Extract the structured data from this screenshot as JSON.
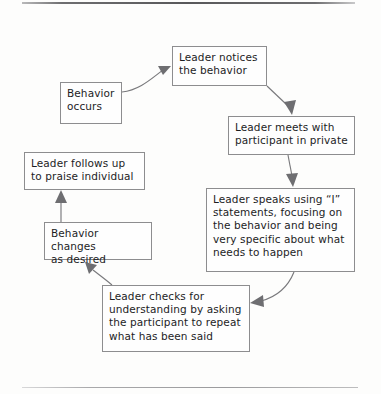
{
  "page": {
    "background_color": "#fdfdfc",
    "border_color": "#8d8d8f",
    "text_color": "#1d1d1f",
    "edge_color": "#79797c"
  },
  "rules": {
    "top_rule_label": "top-divider-rule",
    "bottom_rule_label": "bottom-divider-rule"
  },
  "diagram": {
    "type": "cycle-flowchart",
    "nodes": [
      {
        "id": "behavior-occurs",
        "text": "Behavior\noccurs",
        "lines": [
          "Behavior",
          "occurs"
        ],
        "x": 60,
        "y": 82,
        "w": 62,
        "h": 42
      },
      {
        "id": "leader-notices",
        "text": "Leader notices\nthe behavior",
        "lines": [
          "Leader notices",
          "the behavior"
        ],
        "x": 172,
        "y": 46,
        "w": 95,
        "h": 40
      },
      {
        "id": "leader-meets",
        "text": "Leader meets with\nparticipant in private",
        "lines": [
          "Leader meets with",
          "participant in private"
        ],
        "x": 228,
        "y": 116,
        "w": 127,
        "h": 39
      },
      {
        "id": "leader-speaks",
        "text": "Leader speaks using “I” statements, focusing on the behavior and being very specific about what needs to happen",
        "lines": [
          "Leader speaks using “I”",
          "statements, focusing on",
          "the behavior and being",
          "very specific about what",
          "needs to happen"
        ],
        "x": 206,
        "y": 188,
        "w": 149,
        "h": 84
      },
      {
        "id": "leader-checks",
        "text": "Leader checks for understanding by asking the participant to repeat what has been said",
        "lines": [
          "Leader checks for",
          "understanding by asking",
          "the participant to repeat",
          "what has been said"
        ],
        "x": 102,
        "y": 285,
        "w": 148,
        "h": 67
      },
      {
        "id": "behavior-changes",
        "text": "Behavior changes\nas desired",
        "lines": [
          "Behavior changes",
          "as desired"
        ],
        "x": 44,
        "y": 222,
        "w": 108,
        "h": 38
      },
      {
        "id": "leader-follows-up",
        "text": "Leader follows up\nto praise individual",
        "lines": [
          "Leader follows up",
          "to praise individual"
        ],
        "x": 24,
        "y": 152,
        "w": 121,
        "h": 38
      }
    ],
    "edges": [
      {
        "id": "edge-occurs-to-notices",
        "from": "behavior-occurs",
        "to": "leader-notices",
        "style": "curved"
      },
      {
        "id": "edge-notices-to-meets",
        "from": "leader-notices",
        "to": "leader-meets",
        "style": "diagonal"
      },
      {
        "id": "edge-meets-to-speaks",
        "from": "leader-meets",
        "to": "leader-speaks",
        "style": "vertical"
      },
      {
        "id": "edge-speaks-to-checks",
        "from": "leader-speaks",
        "to": "leader-checks",
        "style": "curved"
      },
      {
        "id": "edge-checks-to-changes",
        "from": "leader-checks",
        "to": "behavior-changes",
        "style": "curved"
      },
      {
        "id": "edge-changes-to-follows-up",
        "from": "behavior-changes",
        "to": "leader-follows-up",
        "style": "vertical"
      }
    ]
  }
}
